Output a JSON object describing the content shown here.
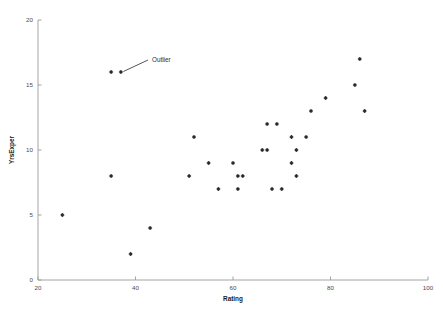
{
  "chart_data": {
    "type": "scatter",
    "title": "",
    "xlabel": "Rating",
    "ylabel": "YrsExper",
    "xlim": [
      20,
      100
    ],
    "ylim": [
      0,
      20
    ],
    "xticks": [
      20,
      40,
      60,
      80,
      100
    ],
    "yticks": [
      0,
      5,
      10,
      15,
      20
    ],
    "grid": false,
    "legend": null,
    "marker": "dot",
    "marker_color": "#2b2b2b",
    "series": [
      {
        "name": "YrsExper vs Rating",
        "points": [
          {
            "x": 25,
            "y": 5
          },
          {
            "x": 35,
            "y": 8
          },
          {
            "x": 35,
            "y": 16
          },
          {
            "x": 37,
            "y": 16
          },
          {
            "x": 39,
            "y": 2
          },
          {
            "x": 43,
            "y": 4
          },
          {
            "x": 51,
            "y": 8
          },
          {
            "x": 52,
            "y": 11
          },
          {
            "x": 55,
            "y": 9
          },
          {
            "x": 57,
            "y": 7
          },
          {
            "x": 60,
            "y": 9
          },
          {
            "x": 61,
            "y": 7
          },
          {
            "x": 61,
            "y": 8
          },
          {
            "x": 62,
            "y": 8
          },
          {
            "x": 66,
            "y": 10
          },
          {
            "x": 67,
            "y": 12
          },
          {
            "x": 67,
            "y": 10
          },
          {
            "x": 68,
            "y": 7
          },
          {
            "x": 69,
            "y": 12
          },
          {
            "x": 70,
            "y": 7
          },
          {
            "x": 72,
            "y": 11
          },
          {
            "x": 72,
            "y": 9
          },
          {
            "x": 73,
            "y": 8
          },
          {
            "x": 73,
            "y": 10
          },
          {
            "x": 75,
            "y": 11
          },
          {
            "x": 76,
            "y": 13
          },
          {
            "x": 79,
            "y": 14
          },
          {
            "x": 85,
            "y": 15
          },
          {
            "x": 86,
            "y": 17
          },
          {
            "x": 87,
            "y": 13
          }
        ]
      }
    ],
    "annotations": [
      {
        "label": "Outlier",
        "text_x": 152,
        "text_y": 62,
        "target_points": [
          {
            "x": 37,
            "y": 16
          }
        ]
      }
    ]
  }
}
